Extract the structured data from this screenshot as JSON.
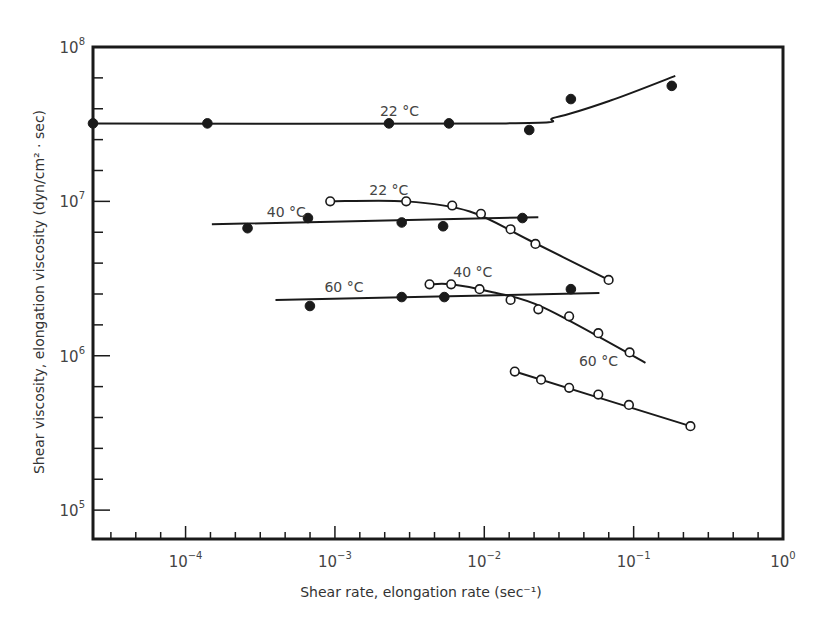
{
  "chart_data": {
    "type": "scatter",
    "title": "",
    "xlabel": "Shear rate, elongation rate (sec⁻¹)",
    "ylabel": "Shear viscosity, elongation viscosity (dyn/cm² · sec)",
    "xscale": "log",
    "yscale": "log",
    "xlim": [
      2.4e-05,
      1
    ],
    "ylim": [
      65000.0,
      100000000.0
    ],
    "grid": false,
    "legend": "none (curves annotated inline)",
    "x_ticks": [
      {
        "value": 0.0001,
        "base": "10",
        "exp": "−4"
      },
      {
        "value": 0.001,
        "base": "10",
        "exp": "−3"
      },
      {
        "value": 0.01,
        "base": "10",
        "exp": "−2"
      },
      {
        "value": 0.1,
        "base": "10",
        "exp": "−1"
      },
      {
        "value": 1,
        "base": "10",
        "exp": "0"
      }
    ],
    "y_ticks": [
      {
        "value": 100000.0,
        "base": "10",
        "exp": "5"
      },
      {
        "value": 1000000.0,
        "base": "10",
        "exp": "6"
      },
      {
        "value": 10000000.0,
        "base": "10",
        "exp": "7"
      },
      {
        "value": 100000000.0,
        "base": "10",
        "exp": "8"
      }
    ],
    "series": [
      {
        "name": "Shear viscosity 22 °C",
        "marker": "filled",
        "label": "22 °C",
        "x": [
          2.4e-05,
          0.00014,
          0.0023,
          0.0058,
          0.02,
          0.038,
          0.18
        ],
        "y": [
          32000000.0,
          32000000.0,
          32000000.0,
          32000000.0,
          29000000.0,
          46000000.0,
          56000000.0
        ],
        "fit": {
          "x": [
            2.4e-05,
            0.014,
            0.03,
            0.07,
            0.19
          ],
          "y": [
            32000000.0,
            32000000.0,
            35000000.0,
            45000000.0,
            65000000.0
          ]
        }
      },
      {
        "name": "Shear viscosity 40 °C",
        "marker": "filled",
        "label": "40 °C",
        "x": [
          0.00026,
          0.00066,
          0.0028,
          0.0053,
          0.018
        ],
        "y": [
          6700000.0,
          7800000.0,
          7300000.0,
          6900000.0,
          7800000.0
        ],
        "fit": {
          "x": [
            0.00015,
            0.023
          ],
          "y": [
            7100000.0,
            7900000.0
          ]
        }
      },
      {
        "name": "Shear viscosity 60 °C",
        "marker": "filled",
        "label": "60 °C",
        "x": [
          0.00068,
          0.0028,
          0.0054,
          0.038
        ],
        "y": [
          2100000.0,
          2400000.0,
          2400000.0,
          2700000.0
        ],
        "fit": {
          "x": [
            0.0004,
            0.059
          ],
          "y": [
            2300000.0,
            2550000.0
          ]
        }
      },
      {
        "name": "Elongation viscosity 22 °C",
        "marker": "open",
        "label": "22 °C",
        "x": [
          0.00093,
          0.003,
          0.0061,
          0.0095,
          0.015,
          0.022,
          0.068
        ],
        "y": [
          10000000.0,
          10000000.0,
          9400000.0,
          8300000.0,
          6600000.0,
          5300000.0,
          3100000.0
        ],
        "fit": {
          "x": [
            0.00093,
            0.003,
            0.008,
            0.02,
            0.068
          ],
          "y": [
            10000000.0,
            10000000.0,
            8600000.0,
            5600000.0,
            3100000.0
          ]
        }
      },
      {
        "name": "Elongation viscosity 40 °C",
        "marker": "open",
        "label": "40 °C",
        "x": [
          0.0043,
          0.006,
          0.0093,
          0.015,
          0.023,
          0.037,
          0.058,
          0.094
        ],
        "y": [
          2900000.0,
          2900000.0,
          2700000.0,
          2300000.0,
          2000000.0,
          1800000.0,
          1400000.0,
          1050000.0
        ],
        "fit": {
          "x": [
            0.0043,
            0.006,
            0.011,
            0.025,
            0.12
          ],
          "y": [
            2900000.0,
            2900000.0,
            2600000.0,
            2050000.0,
            900000.0
          ]
        }
      },
      {
        "name": "Elongation viscosity 60 °C",
        "marker": "open",
        "label": "60 °C",
        "x": [
          0.016,
          0.024,
          0.037,
          0.058,
          0.093,
          0.24
        ],
        "y": [
          790000.0,
          700000.0,
          620000.0,
          560000.0,
          480000.0,
          350000.0
        ],
        "fit": {
          "x": [
            0.016,
            0.24
          ],
          "y": [
            790000.0,
            350000.0
          ]
        }
      }
    ],
    "annotations": [
      {
        "text": "22 °C",
        "x": 0.002,
        "y": 35500000.0,
        "ref": "Shear viscosity 22 °C"
      },
      {
        "text": "40 °C",
        "x": 0.00035,
        "y": 7950000.0,
        "ref": "Shear viscosity 40 °C"
      },
      {
        "text": "60 °C",
        "x": 0.00085,
        "y": 2600000.0,
        "ref": "Shear viscosity 60 °C"
      },
      {
        "text": "22 °C",
        "x": 0.0017,
        "y": 11000000.0,
        "ref": "Elongation viscosity 22 °C"
      },
      {
        "text": "40 °C",
        "x": 0.0062,
        "y": 3250000.0,
        "ref": "Elongation viscosity 40 °C"
      },
      {
        "text": "60 °C",
        "x": 0.043,
        "y": 860000.0,
        "ref": "Elongation viscosity 60 °C"
      }
    ]
  }
}
